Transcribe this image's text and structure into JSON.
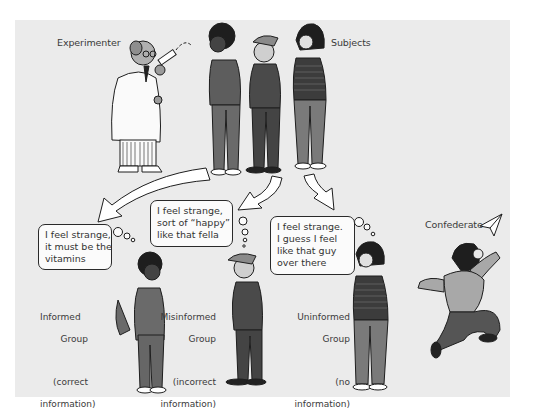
{
  "figure": {
    "labels": {
      "experimenter": "Experimenter",
      "subjects": "Subjects",
      "confederate": "Confederate"
    },
    "groups": [
      {
        "name_line1": "Informed",
        "name_line2": "Group",
        "info_line1": "(correct",
        "info_line2": "information)"
      },
      {
        "name_line1": "Misinformed",
        "name_line2": "Group",
        "info_line1": "(incorrect",
        "info_line2": "information)"
      },
      {
        "name_line1": "Uninformed",
        "name_line2": "Group",
        "info_line1": "(no",
        "info_line2": "information)"
      }
    ],
    "thoughts": [
      {
        "line1": "I feel strange,",
        "line2": "it must be the",
        "line3": "vitamins"
      },
      {
        "line1": "I feel strange,",
        "line2": "sort of “happy”",
        "line3": "like that fella"
      },
      {
        "line1": "I feel strange.",
        "line2": "I guess I feel",
        "line3": "like that guy",
        "line4": "over there"
      }
    ],
    "colors": {
      "panel_bg": "#ebebeb",
      "clothing_dark": "#5a5a5a",
      "clothing_mid": "#8a8a8a",
      "outline": "#1e1e1e",
      "arrow_fill": "#ffffff"
    }
  }
}
